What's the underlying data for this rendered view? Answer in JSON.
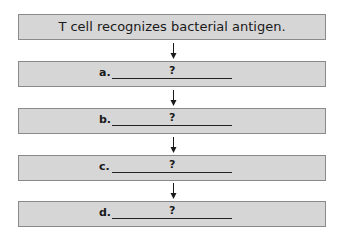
{
  "diagram": {
    "start": {
      "text": "T cell recognizes bacterial antigen."
    },
    "steps": [
      {
        "label": "a.",
        "answer": "?"
      },
      {
        "label": "b.",
        "answer": "?"
      },
      {
        "label": "c.",
        "answer": "?"
      },
      {
        "label": "d.",
        "answer": "?"
      }
    ],
    "colors": {
      "box_fill": "#d6d6d6",
      "box_border": "#8a8a8a",
      "arrow": "#1a1a1a"
    }
  }
}
